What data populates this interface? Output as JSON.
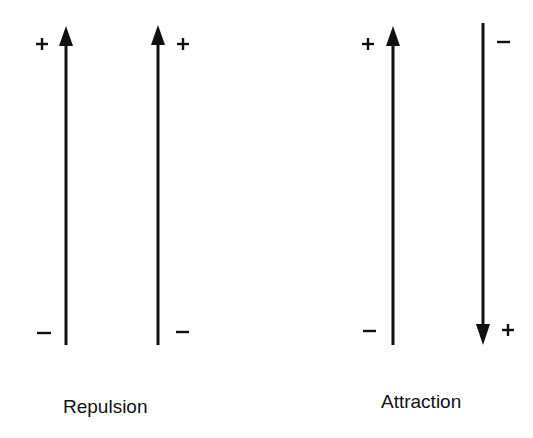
{
  "colors": {
    "ink": "#111111",
    "background": "#ffffff"
  },
  "groups": [
    {
      "label": "Repulsion",
      "arrows": [
        {
          "direction": "up",
          "top_sign": "+",
          "bottom_sign": "−",
          "sign_side": "left"
        },
        {
          "direction": "up",
          "top_sign": "+",
          "bottom_sign": "−",
          "sign_side": "right"
        }
      ]
    },
    {
      "label": "Attraction",
      "arrows": [
        {
          "direction": "up",
          "top_sign": "+",
          "bottom_sign": "−",
          "sign_side": "left"
        },
        {
          "direction": "down",
          "top_sign": "−",
          "bottom_sign": "+",
          "sign_side": "right"
        }
      ]
    }
  ]
}
